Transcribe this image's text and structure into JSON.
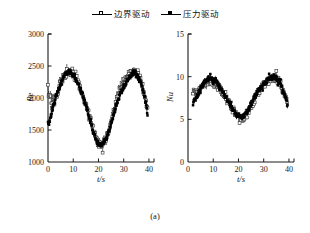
{
  "figure": {
    "caption": "(a)",
    "legend": [
      {
        "label": "边界驱动",
        "marker": "open-square-marker",
        "color": "#000000",
        "style": "line-with-open-square"
      },
      {
        "label": "压力驱动",
        "marker": "filled-square-marker",
        "color": "#000000",
        "style": "line-with-filled-square"
      }
    ]
  },
  "chart_data": [
    {
      "type": "scatter",
      "panel": "left",
      "title": "",
      "xlabel": "t/s",
      "ylabel": "Re",
      "xlim": [
        0,
        42
      ],
      "ylim": [
        1000,
        3000
      ],
      "xticks": [
        0,
        10,
        20,
        30,
        40
      ],
      "yticks": [
        1000,
        1500,
        2000,
        2500,
        3000
      ],
      "grid": false,
      "legend_position": "above-figure",
      "series": [
        {
          "name": "边界驱动",
          "marker": "open-square",
          "x": [
            0,
            0.5,
            1,
            1.5,
            2,
            2.5,
            3,
            3.5,
            4,
            4.5,
            5,
            5.5,
            6,
            6.5,
            7,
            7.5,
            8,
            8.5,
            9,
            9.5,
            10,
            10.5,
            11,
            11.5,
            12,
            12.5,
            13,
            13.5,
            14,
            14.5,
            15,
            15.5,
            16,
            16.5,
            17,
            17.5,
            18,
            18.5,
            19,
            19.5,
            20,
            20.5,
            21,
            21.5,
            22,
            22.5,
            23,
            23.5,
            24,
            24.5,
            25,
            25.5,
            26,
            26.5,
            27,
            27.5,
            28,
            28.5,
            29,
            29.5,
            30,
            30.5,
            31,
            31.5,
            32,
            32.5,
            33,
            33.5,
            34,
            34.5,
            35,
            35.5,
            36,
            36.5,
            37,
            37.5,
            38,
            38.5,
            39,
            39.5
          ],
          "y": [
            2150,
            1980,
            2080,
            1900,
            2010,
            1930,
            1990,
            2060,
            2110,
            2180,
            2230,
            2280,
            2310,
            2350,
            2370,
            2395,
            2410,
            2420,
            2400,
            2380,
            2360,
            2330,
            2300,
            2265,
            2230,
            2180,
            2130,
            2080,
            2020,
            1960,
            1900,
            1830,
            1760,
            1690,
            1620,
            1550,
            1480,
            1420,
            1370,
            1330,
            1300,
            1280,
            1275,
            1285,
            1300,
            1330,
            1370,
            1420,
            1480,
            1550,
            1620,
            1700,
            1780,
            1860,
            1940,
            2010,
            2080,
            2140,
            2190,
            2230,
            2260,
            2290,
            2320,
            2345,
            2370,
            2390,
            2405,
            2420,
            2430,
            2425,
            2410,
            2385,
            2350,
            2300,
            2240,
            2170,
            2090,
            2000,
            1900,
            1790
          ]
        },
        {
          "name": "压力驱动",
          "marker": "filled-square",
          "x": [
            0,
            0.5,
            1,
            1.5,
            2,
            2.5,
            3,
            3.5,
            4,
            4.5,
            5,
            5.5,
            6,
            6.5,
            7,
            7.5,
            8,
            8.5,
            9,
            9.5,
            10,
            10.5,
            11,
            11.5,
            12,
            12.5,
            13,
            13.5,
            14,
            14.5,
            15,
            15.5,
            16,
            16.5,
            17,
            17.5,
            18,
            18.5,
            19,
            19.5,
            20,
            20.5,
            21,
            21.5,
            22,
            22.5,
            23,
            23.5,
            24,
            24.5,
            25,
            25.5,
            26,
            26.5,
            27,
            27.5,
            28,
            28.5,
            29,
            29.5,
            30,
            30.5,
            31,
            31.5,
            32,
            32.5,
            33,
            33.5,
            34,
            34.5,
            35,
            35.5,
            36,
            36.5,
            37,
            37.5,
            38,
            38.5,
            39,
            39.5
          ],
          "y": [
            1560,
            1620,
            1700,
            1780,
            1860,
            1930,
            1990,
            2050,
            2110,
            2170,
            2220,
            2270,
            2310,
            2345,
            2370,
            2390,
            2400,
            2410,
            2395,
            2375,
            2350,
            2320,
            2290,
            2255,
            2215,
            2170,
            2120,
            2065,
            2005,
            1945,
            1880,
            1810,
            1740,
            1670,
            1600,
            1530,
            1465,
            1405,
            1355,
            1315,
            1290,
            1275,
            1272,
            1282,
            1300,
            1330,
            1365,
            1410,
            1465,
            1530,
            1600,
            1670,
            1740,
            1810,
            1880,
            1945,
            2000,
            2050,
            2095,
            2135,
            2170,
            2205,
            2240,
            2275,
            2305,
            2335,
            2360,
            2385,
            2400,
            2395,
            2380,
            2350,
            2310,
            2260,
            2205,
            2140,
            2070,
            1990,
            1900,
            1720
          ]
        }
      ]
    },
    {
      "type": "scatter",
      "panel": "right",
      "title": "",
      "xlabel": "t/s",
      "ylabel": "Nu",
      "xlim": [
        0,
        42
      ],
      "ylim": [
        0,
        15
      ],
      "xticks": [
        0,
        10,
        20,
        30,
        40
      ],
      "yticks": [
        0,
        5,
        10,
        15
      ],
      "grid": false,
      "legend_position": "above-figure",
      "series": [
        {
          "name": "边界驱动",
          "marker": "open-square",
          "x": [
            2,
            2.5,
            3,
            3.5,
            4,
            4.5,
            5,
            5.5,
            6,
            6.5,
            7,
            7.5,
            8,
            8.5,
            9,
            9.5,
            10,
            10.5,
            11,
            11.5,
            12,
            12.5,
            13,
            13.5,
            14,
            14.5,
            15,
            15.5,
            16,
            16.5,
            17,
            17.5,
            18,
            18.5,
            19,
            19.5,
            20,
            20.5,
            21,
            21.5,
            22,
            22.5,
            23,
            23.5,
            24,
            24.5,
            25,
            25.5,
            26,
            26.5,
            27,
            27.5,
            28,
            28.5,
            29,
            29.5,
            30,
            30.5,
            31,
            31.5,
            32,
            32.5,
            33,
            33.5,
            34,
            34.5,
            35,
            35.5,
            36,
            36.5,
            37,
            37.5,
            38,
            38.5,
            39,
            39.5
          ],
          "y": [
            8.4,
            8.1,
            8.3,
            8.0,
            8.2,
            8.4,
            8.6,
            8.8,
            9.0,
            9.15,
            9.3,
            9.4,
            9.45,
            9.5,
            9.45,
            9.4,
            9.3,
            9.2,
            9.1,
            8.95,
            8.8,
            8.6,
            8.4,
            8.2,
            8.0,
            7.75,
            7.5,
            7.25,
            7.0,
            6.75,
            6.5,
            6.25,
            6.0,
            5.8,
            5.6,
            5.45,
            5.35,
            5.25,
            5.2,
            5.2,
            5.25,
            5.35,
            5.5,
            5.7,
            5.95,
            6.2,
            6.5,
            6.8,
            7.1,
            7.4,
            7.7,
            8.0,
            8.25,
            8.5,
            8.7,
            8.9,
            9.05,
            9.2,
            9.35,
            9.5,
            9.6,
            9.7,
            9.8,
            9.85,
            9.9,
            9.85,
            9.8,
            9.65,
            9.45,
            9.2,
            8.9,
            8.55,
            8.15,
            7.7,
            7.2,
            6.5
          ]
        },
        {
          "name": "压力驱动",
          "marker": "filled-square",
          "x": [
            2,
            2.5,
            3,
            3.5,
            4,
            4.5,
            5,
            5.5,
            6,
            6.5,
            7,
            7.5,
            8,
            8.5,
            9,
            9.5,
            10,
            10.5,
            11,
            11.5,
            12,
            12.5,
            13,
            13.5,
            14,
            14.5,
            15,
            15.5,
            16,
            16.5,
            17,
            17.5,
            18,
            18.5,
            19,
            19.5,
            20,
            20.5,
            21,
            21.5,
            22,
            22.5,
            23,
            23.5,
            24,
            24.5,
            25,
            25.5,
            26,
            26.5,
            27,
            27.5,
            28,
            28.5,
            29,
            29.5,
            30,
            30.5,
            31,
            31.5,
            32,
            32.5,
            33,
            33.5,
            34,
            34.5,
            35,
            35.5,
            36,
            36.5,
            37,
            37.5,
            38,
            38.5,
            39,
            39.5
          ],
          "y": [
            6.8,
            7.1,
            7.4,
            7.7,
            8.0,
            8.3,
            8.6,
            8.85,
            9.1,
            9.3,
            9.5,
            9.65,
            9.75,
            9.85,
            9.8,
            9.75,
            9.65,
            9.55,
            9.4,
            9.25,
            9.05,
            8.85,
            8.6,
            8.35,
            8.1,
            7.85,
            7.6,
            7.3,
            7.0,
            6.7,
            6.45,
            6.2,
            6.0,
            5.8,
            5.65,
            5.5,
            5.4,
            5.35,
            5.3,
            5.3,
            5.35,
            5.5,
            5.7,
            5.95,
            6.2,
            6.5,
            6.8,
            7.1,
            7.4,
            7.7,
            7.95,
            8.2,
            8.45,
            8.65,
            8.85,
            9.0,
            9.15,
            9.3,
            9.45,
            9.6,
            9.7,
            9.8,
            9.9,
            9.95,
            10.0,
            9.95,
            9.85,
            9.7,
            9.5,
            9.25,
            8.95,
            8.6,
            8.2,
            7.75,
            7.2,
            6.3
          ]
        }
      ]
    }
  ]
}
